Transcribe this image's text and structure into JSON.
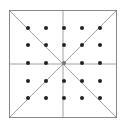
{
  "diagram": {
    "square": {
      "x": 9,
      "y": 10,
      "size": 107,
      "stroke": "#888888"
    },
    "line_color": "#a0a0a0",
    "dot_color": "#222222",
    "dot_radius": 2,
    "grid": {
      "rows": 5,
      "cols": 5
    },
    "dot_x": [
      28,
      46,
      64,
      82,
      100
    ],
    "dot_y": [
      28,
      45,
      63,
      81,
      98
    ]
  }
}
